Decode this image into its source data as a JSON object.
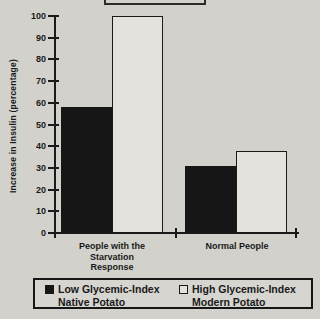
{
  "figure": {
    "background": "#d2d1cd",
    "ink": "#1a1a1a",
    "bar_fill_dark": "#161616",
    "bar_fill_light": "#e3e2dd",
    "title_box": {
      "text": "",
      "note": "title box cut off at top edge of screenshot"
    }
  },
  "chart_data": {
    "type": "bar",
    "title": "",
    "xlabel": "",
    "ylabel": "Increase in Insulin (percentage)",
    "categories": [
      "People with the Starvation Response",
      "Normal People"
    ],
    "category_lines": [
      [
        "People with the",
        "Starvation",
        "Response"
      ],
      [
        "Normal People"
      ]
    ],
    "series": [
      {
        "name": "Low Glycemic-Index Native Potato",
        "swatch": "filled",
        "values": [
          58,
          31
        ]
      },
      {
        "name": "High Glycemic-Index Modern Potato",
        "swatch": "open",
        "values": [
          100,
          38
        ]
      }
    ],
    "ylim": [
      0,
      100
    ],
    "ytick_step": 10,
    "ytick_labels": [
      "0",
      "10",
      "20",
      "30",
      "40",
      "50",
      "60",
      "70",
      "80",
      "90",
      "100"
    ],
    "grid": false,
    "legend_position": "bottom"
  },
  "legend": {
    "items": [
      {
        "line1": "Low Glycemic-Index",
        "line2": "Native Potato",
        "swatch": "filled"
      },
      {
        "line1": "High Glycemic-Index",
        "line2": "Modern Potato",
        "swatch": "open"
      }
    ]
  }
}
